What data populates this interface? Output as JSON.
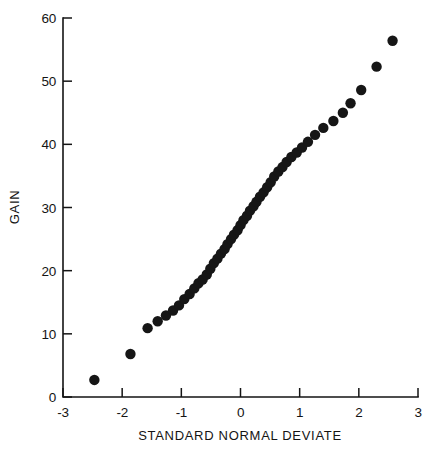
{
  "chart_data": {
    "type": "scatter",
    "title": "",
    "xlabel": "STANDARD NORMAL DEVIATE",
    "ylabel": "GAIN",
    "xlim": [
      -3,
      3
    ],
    "ylim": [
      0,
      60
    ],
    "xticks": [
      -3,
      -2,
      -1,
      0,
      1,
      2,
      3
    ],
    "xtick_labels": [
      "-3",
      "-2",
      "-1",
      "0",
      "1",
      "2",
      "3"
    ],
    "yticks": [
      0,
      10,
      20,
      30,
      40,
      50,
      60
    ],
    "ytick_labels": [
      "0",
      "10",
      "20",
      "30",
      "40",
      "50",
      "60"
    ],
    "grid": false,
    "legend": null,
    "marker": "filled-circle",
    "marker_color": "#161616",
    "marker_size_px": 5.2,
    "n_points": 48,
    "x": [
      -2.47,
      -1.86,
      -1.57,
      -1.4,
      -1.26,
      -1.14,
      -1.04,
      -0.95,
      -0.86,
      -0.78,
      -0.71,
      -0.64,
      -0.57,
      -0.51,
      -0.45,
      -0.39,
      -0.33,
      -0.27,
      -0.22,
      -0.16,
      -0.11,
      -0.05,
      0.0,
      0.05,
      0.11,
      0.16,
      0.22,
      0.27,
      0.33,
      0.39,
      0.45,
      0.51,
      0.57,
      0.64,
      0.71,
      0.78,
      0.86,
      0.95,
      1.04,
      1.14,
      1.26,
      1.4,
      1.57,
      1.73,
      1.86,
      2.04,
      2.3,
      2.57
    ],
    "y": [
      2.7,
      6.8,
      10.9,
      12.0,
      12.9,
      13.7,
      14.5,
      15.5,
      16.3,
      17.2,
      18.0,
      18.6,
      19.4,
      20.3,
      21.2,
      21.9,
      22.7,
      23.4,
      24.2,
      25.0,
      25.7,
      26.4,
      27.2,
      28.0,
      28.7,
      29.5,
      30.2,
      30.9,
      31.7,
      32.4,
      33.2,
      34.0,
      34.9,
      35.7,
      36.4,
      37.2,
      38.0,
      38.7,
      39.5,
      40.4,
      41.5,
      42.6,
      43.7,
      45.0,
      46.5,
      48.6,
      52.3,
      56.4
    ]
  },
  "axes": {
    "x_label": "STANDARD NORMAL DEVIATE",
    "y_label": "GAIN"
  }
}
